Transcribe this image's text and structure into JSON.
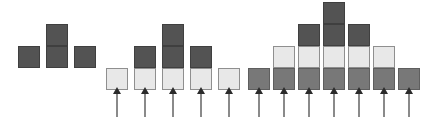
{
  "figure": {
    "title": "",
    "type": "block-stack-diagram",
    "canvas": {
      "width": 424,
      "height": 120,
      "background": "#ffffff"
    },
    "palette": {
      "dark": "#535353",
      "mid": "#787878",
      "light": "#e8e8e8",
      "border": "#7d7d7d",
      "arrow_stem": "#8a8a8a",
      "arrow_head": "#2b2b2b"
    },
    "cell_size": 22,
    "groups": [
      {
        "id": "group-1",
        "label": "group-1",
        "origin_x": 18,
        "baseline_y": 68,
        "column_pitch": 28,
        "has_arrows": false,
        "columns": [
          {
            "index": 1,
            "segments": [
              "dark"
            ]
          },
          {
            "index": 2,
            "segments": [
              "dark",
              "dark"
            ]
          },
          {
            "index": 3,
            "segments": [
              "dark"
            ]
          }
        ]
      },
      {
        "id": "group-2",
        "label": "group-2",
        "origin_x": 106,
        "baseline_y": 90,
        "column_pitch": 28,
        "has_arrows": true,
        "arrow_length": 24,
        "columns": [
          {
            "index": 1,
            "segments": [
              "light"
            ]
          },
          {
            "index": 2,
            "segments": [
              "light",
              "dark"
            ]
          },
          {
            "index": 3,
            "segments": [
              "light",
              "dark",
              "dark"
            ]
          },
          {
            "index": 4,
            "segments": [
              "light",
              "dark"
            ]
          },
          {
            "index": 5,
            "segments": [
              "light"
            ]
          }
        ]
      },
      {
        "id": "group-3",
        "label": "group-3",
        "origin_x": 248,
        "baseline_y": 90,
        "column_pitch": 25,
        "has_arrows": true,
        "arrow_length": 24,
        "columns": [
          {
            "index": 1,
            "segments": [
              "mid"
            ]
          },
          {
            "index": 2,
            "segments": [
              "mid",
              "light"
            ]
          },
          {
            "index": 3,
            "segments": [
              "mid",
              "light",
              "dark"
            ]
          },
          {
            "index": 4,
            "segments": [
              "mid",
              "light",
              "dark",
              "dark"
            ]
          },
          {
            "index": 5,
            "segments": [
              "mid",
              "light",
              "dark"
            ]
          },
          {
            "index": 6,
            "segments": [
              "mid",
              "light"
            ]
          },
          {
            "index": 7,
            "segments": [
              "mid"
            ]
          }
        ]
      }
    ]
  }
}
